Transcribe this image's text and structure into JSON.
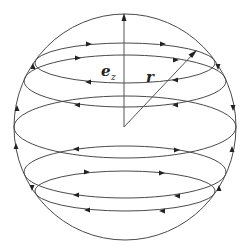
{
  "figure": {
    "labels": {
      "ez_main": "e",
      "ez_sub": "z",
      "r": "r"
    },
    "colors": {
      "line": "#4a4a4a",
      "arrow": "#222222",
      "background": "#ffffff"
    },
    "sphere": {
      "cx": 125,
      "cy": 127,
      "rx": 111,
      "ry": 113
    },
    "latitude_ellipses": [
      {
        "id": "E1",
        "cx": 125,
        "cy": 63,
        "rx": 90,
        "ry": 20,
        "back_arrow_dir": "right",
        "front_arrow_dir": "left"
      },
      {
        "id": "E2",
        "cx": 125,
        "cy": 81,
        "rx": 101,
        "ry": 26,
        "back_arrow_dir": "right",
        "front_arrow_dir": "left"
      },
      {
        "id": "E3",
        "cx": 125,
        "cy": 127,
        "rx": 111,
        "ry": 31,
        "back_arrow_dir": "none",
        "front_arrow_dir": "none"
      },
      {
        "id": "E4",
        "cx": 125,
        "cy": 172,
        "rx": 101,
        "ry": 26,
        "back_arrow_dir": "right",
        "front_arrow_dir": "left"
      },
      {
        "id": "E5",
        "cx": 125,
        "cy": 191,
        "rx": 90,
        "ry": 20,
        "back_arrow_dir": "right",
        "front_arrow_dir": "left"
      }
    ],
    "vectors": [
      {
        "name": "e_z",
        "from": [
          124,
          127
        ],
        "to": [
          124,
          14
        ]
      },
      {
        "name": "r",
        "from": [
          124,
          127
        ],
        "to": [
          196,
          51
        ]
      }
    ]
  }
}
